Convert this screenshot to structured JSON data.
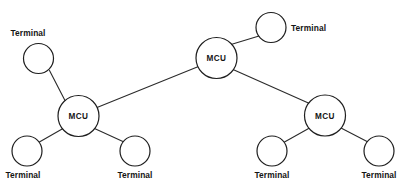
{
  "diagram": {
    "type": "network-topology",
    "title": "",
    "canvas": {
      "width": 408,
      "height": 189,
      "background": "#ffffff"
    },
    "style": {
      "line_color": "#2b2b2b",
      "node_stroke": "#1e1e1e",
      "node_fill": "#ffffff",
      "text_color": "#151515"
    },
    "node_labels": {
      "mcu": "MCU",
      "terminal": "Terminal"
    },
    "nodes": [
      {
        "id": "mcu-center",
        "label": "MCU",
        "kind": "mcu",
        "cx": 216.5,
        "cy": 58.0,
        "r": 20.5
      },
      {
        "id": "mcu-left",
        "label": "MCU",
        "kind": "mcu",
        "cx": 78.5,
        "cy": 116.0,
        "r": 20.5
      },
      {
        "id": "mcu-right",
        "label": "MCU",
        "kind": "mcu",
        "cx": 325.0,
        "cy": 115.5,
        "r": 20.5
      },
      {
        "id": "term-top-left",
        "label": "Terminal",
        "kind": "terminal",
        "cx": 38.5,
        "cy": 58.5,
        "r": 15.0
      },
      {
        "id": "term-top-right",
        "label": "Terminal",
        "kind": "terminal",
        "cx": 271.0,
        "cy": 27.5,
        "r": 15.0
      },
      {
        "id": "term-bot-1",
        "label": "Terminal",
        "kind": "terminal",
        "cx": 27.0,
        "cy": 151.0,
        "r": 15.0
      },
      {
        "id": "term-bot-2",
        "label": "Terminal",
        "kind": "terminal",
        "cx": 135.0,
        "cy": 151.0,
        "r": 15.0
      },
      {
        "id": "term-bot-3",
        "label": "Terminal",
        "kind": "terminal",
        "cx": 272.0,
        "cy": 151.0,
        "r": 15.0
      },
      {
        "id": "term-bot-4",
        "label": "Terminal",
        "kind": "terminal",
        "cx": 379.0,
        "cy": 151.0,
        "r": 15.0
      }
    ],
    "labels": [
      {
        "for": "term-top-left",
        "text": "Terminal",
        "x": 28.0,
        "y": 36.0,
        "anchor": "middle"
      },
      {
        "for": "term-top-right",
        "text": "Terminal",
        "x": 291.0,
        "y": 31.0,
        "anchor": "start"
      },
      {
        "for": "term-bot-1",
        "text": "Terminal",
        "x": 23.0,
        "y": 178.0,
        "anchor": "middle"
      },
      {
        "for": "term-bot-2",
        "text": "Terminal",
        "x": 135.0,
        "y": 178.0,
        "anchor": "middle"
      },
      {
        "for": "term-bot-3",
        "text": "Terminal",
        "x": 272.0,
        "y": 178.0,
        "anchor": "middle"
      },
      {
        "for": "term-bot-4",
        "text": "Terminal",
        "x": 379.0,
        "y": 178.0,
        "anchor": "middle"
      }
    ],
    "links": [
      {
        "id": "link-mcul-mcuc",
        "from": "mcu-left",
        "to": "mcu-center",
        "x1": 97.0,
        "y1": 107.5,
        "x2": 198.5,
        "y2": 66.5
      },
      {
        "id": "link-mcuc-mcur",
        "from": "mcu-center",
        "to": "mcu-right",
        "x1": 233.0,
        "y1": 69.5,
        "x2": 309.5,
        "y2": 103.5
      },
      {
        "id": "link-mcuc-termtr",
        "from": "mcu-center",
        "to": "term-top-right",
        "x1": 231.0,
        "y1": 44.5,
        "x2": 259.0,
        "y2": 36.0
      },
      {
        "id": "link-mcul-termtl",
        "from": "mcu-left",
        "to": "term-top-left",
        "x1": 65.5,
        "y1": 101.5,
        "x2": 49.5,
        "y2": 70.5
      },
      {
        "id": "link-mcul-bot1",
        "from": "mcu-left",
        "to": "term-bot-1",
        "x1": 63.0,
        "y1": 128.5,
        "x2": 38.5,
        "y2": 142.5
      },
      {
        "id": "link-mcul-bot2",
        "from": "mcu-left",
        "to": "term-bot-2",
        "x1": 94.5,
        "y1": 128.5,
        "x2": 124.0,
        "y2": 142.0
      },
      {
        "id": "link-mcur-bot3",
        "from": "mcu-right",
        "to": "term-bot-3",
        "x1": 309.5,
        "y1": 128.0,
        "x2": 284.5,
        "y2": 142.0
      },
      {
        "id": "link-mcur-bot4",
        "from": "mcu-right",
        "to": "term-bot-4",
        "x1": 341.0,
        "y1": 128.0,
        "x2": 368.0,
        "y2": 142.0
      }
    ]
  }
}
